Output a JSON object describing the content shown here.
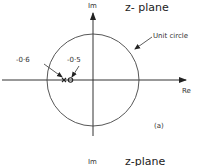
{
  "diagram": {
    "title": "z- plane",
    "axis_labels": {
      "imaginary": "Im",
      "real": "Re"
    },
    "circle_label": "Unit circle",
    "pole_label": "-0·6",
    "zero_label": "-0·5",
    "panel_label": "(a)",
    "pole_value": -0.6,
    "zero_value": -0.5,
    "circle_radius_units": 1
  },
  "next_panel": {
    "axis_label": "Im",
    "title": "z-plane"
  }
}
